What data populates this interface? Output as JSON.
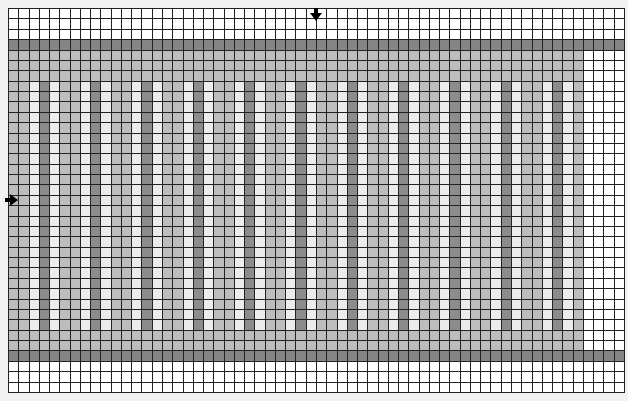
{
  "editor": {
    "cols": 60,
    "rows": 37,
    "cell_width": 10.28,
    "cell_height": 10.38,
    "colors": {
      "empty": "#ffffff",
      "band": "#858585",
      "fill": "#bdbdbd",
      "stripe_light": "#ececec",
      "stripe_dark": "#8c8c8c",
      "gridline": "#222222"
    },
    "regions": {
      "band_rows": [
        3,
        33
      ],
      "fill_rows": [
        4,
        32
      ],
      "fill_cols": [
        0,
        55
      ],
      "pattern_rows": [
        7,
        30
      ],
      "pattern_period": 5,
      "pattern": [
        "fill",
        "fill",
        "stripe_light",
        "stripe_dark",
        "stripe_light"
      ]
    },
    "markers": {
      "column_marker": {
        "direction": "down",
        "col_boundary": 30
      },
      "row_marker": {
        "direction": "right",
        "row": 18
      }
    }
  }
}
